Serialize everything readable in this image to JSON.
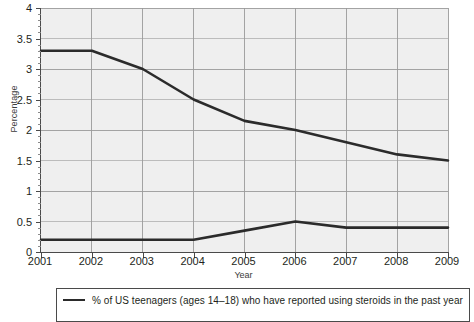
{
  "chart_data": {
    "type": "line",
    "title": "",
    "xlabel": "Year",
    "ylabel": "Percentage",
    "x": [
      2001,
      2002,
      2003,
      2004,
      2005,
      2006,
      2007,
      2008,
      2009
    ],
    "categories": [
      "2001",
      "2002",
      "2003",
      "2004",
      "2005",
      "2006",
      "2007",
      "2008",
      "2009"
    ],
    "xlim": [
      2001,
      2009
    ],
    "ylim": [
      0,
      4
    ],
    "yticks": [
      0,
      0.5,
      1,
      1.5,
      2,
      2.5,
      3,
      3.5,
      4
    ],
    "ytick_labels": [
      "0",
      "0.5",
      "1",
      "1.5",
      "2",
      "2.5",
      "3",
      "3.5",
      "4"
    ],
    "grid": true,
    "legend_position": "bottom",
    "series": [
      {
        "name": "% of US teenagers (ages 14–18) who have reported using steroids in the past year",
        "values": [
          3.3,
          3.3,
          3.0,
          2.5,
          2.15,
          2.0,
          1.8,
          1.6,
          1.5
        ],
        "color": "#2b2b2b"
      },
      {
        "name": "second-series",
        "values": [
          0.2,
          0.2,
          0.2,
          0.2,
          0.35,
          0.5,
          0.4,
          0.4,
          0.4
        ],
        "color": "#2b2b2b"
      }
    ]
  },
  "axes": {
    "y_title": "Percentage",
    "x_title": "Year"
  },
  "legend": {
    "entries": [
      {
        "label": "% of US teenagers (ages 14–18) who have reported using steroids in the past year"
      }
    ]
  },
  "colors": {
    "plot_background": "#efefef",
    "gridline": "#9a9a9a",
    "axis": "#4a4a4a",
    "line": "#2b2b2b",
    "text": "#231f20"
  }
}
